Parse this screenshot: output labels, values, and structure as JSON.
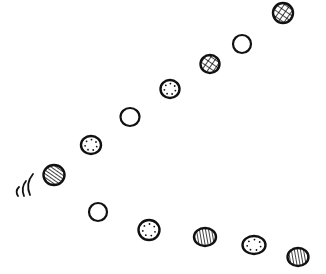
{
  "illustration": {
    "width": 326,
    "height": 274,
    "background": "#ffffff",
    "stroke_color": "#111111",
    "description": "Hand-drawn sequence of patterned circles bouncing along a V-shaped path",
    "circles": [
      {
        "id": 1,
        "cx": 283,
        "cy": 13,
        "rx": 10,
        "ry": 10,
        "pattern": "crosshatch"
      },
      {
        "id": 2,
        "cx": 242,
        "cy": 44,
        "rx": 9,
        "ry": 9,
        "pattern": "empty"
      },
      {
        "id": 3,
        "cx": 210,
        "cy": 64,
        "rx": 9.5,
        "ry": 9,
        "pattern": "crosshatch"
      },
      {
        "id": 4,
        "cx": 170,
        "cy": 89,
        "rx": 9.5,
        "ry": 9,
        "pattern": "dots"
      },
      {
        "id": 5,
        "cx": 130,
        "cy": 117,
        "rx": 9.5,
        "ry": 9,
        "pattern": "empty"
      },
      {
        "id": 6,
        "cx": 91,
        "cy": 145,
        "rx": 10,
        "ry": 9,
        "pattern": "dots"
      },
      {
        "id": 7,
        "cx": 54,
        "cy": 175,
        "rx": 10.5,
        "ry": 10,
        "pattern": "hatch-diagonal"
      },
      {
        "id": 8,
        "cx": 98,
        "cy": 212,
        "rx": 9,
        "ry": 9,
        "pattern": "empty"
      },
      {
        "id": 9,
        "cx": 149,
        "cy": 230,
        "rx": 10.5,
        "ry": 10,
        "pattern": "dots"
      },
      {
        "id": 10,
        "cx": 205,
        "cy": 237,
        "rx": 11,
        "ry": 9,
        "pattern": "hatch-vertical"
      },
      {
        "id": 11,
        "cx": 254,
        "cy": 245,
        "rx": 11.5,
        "ry": 9,
        "pattern": "dots"
      },
      {
        "id": 12,
        "cx": 298,
        "cy": 257,
        "rx": 10.5,
        "ry": 9,
        "pattern": "hatch-vertical"
      }
    ],
    "motion_lines": [
      {
        "d": "M33 174 C28 180 27 188 30 195"
      },
      {
        "d": "M26 181 C22 186 22 191 24 196"
      },
      {
        "d": "M19 187 C16 190 16 193 18 196"
      }
    ]
  }
}
